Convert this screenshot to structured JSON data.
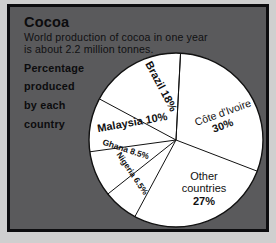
{
  "header": {
    "title": "Cocoa",
    "subtitle_line1": "World production of cocoa in one year",
    "subtitle_line2": "is about 2.2 million tonnes.",
    "lead_line1": "Percentage",
    "lead_line2": "produced",
    "lead_line3": "by each",
    "lead_line4": "country"
  },
  "colors": {
    "panel_background": "#5a5a5c",
    "frame_border": "#0d0d0f",
    "pie_fill": "#ffffff",
    "pie_stroke": "#111111",
    "text": "#0c0c0e"
  },
  "labels": {
    "cote": "Côte d'Ivoire",
    "cote_pct": "30%",
    "other1": "Other",
    "other2": "countries",
    "other_pct": "27%",
    "nigeria": "Nigeria 6.5%",
    "ghana": "Ghana 8.5%",
    "malaysia": "Malaysia 10%",
    "brazil": "Brazil 18%"
  },
  "chart_data": {
    "type": "pie",
    "title": "Cocoa",
    "subtitle": "World production of cocoa in one year is about 2.2 million tonnes. Percentage produced by each country",
    "categories": [
      "Côte d'Ivoire",
      "Other countries",
      "Nigeria",
      "Ghana",
      "Malaysia",
      "Brazil"
    ],
    "values": [
      30,
      27,
      6.5,
      8.5,
      10,
      18
    ],
    "value_labels": [
      "30%",
      "27%",
      "6.5%",
      "8.5%",
      "10%",
      "18%"
    ],
    "unit": "percent",
    "total_production": "2.2 million tonnes",
    "start_angle_deg": 3,
    "direction": "clockwise",
    "legend": "none",
    "grid": false,
    "slice_fill": "#ffffff",
    "slice_stroke": "#111111"
  }
}
